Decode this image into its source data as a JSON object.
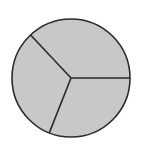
{
  "chart_data": {
    "type": "pie",
    "title": "",
    "categories": [
      "Slice A",
      "Slice B",
      "Slice C"
    ],
    "values": [
      37,
      32,
      31
    ],
    "start_angle_deg": 0,
    "direction": "counterclockwise",
    "legend": "none",
    "labels_shown": false
  },
  "style": {
    "fill": "#c8c8c8",
    "stroke": "#2a2a2a",
    "background": "#ffffff"
  },
  "geometry": {
    "cx": 71,
    "cy": 78,
    "r": 59
  }
}
